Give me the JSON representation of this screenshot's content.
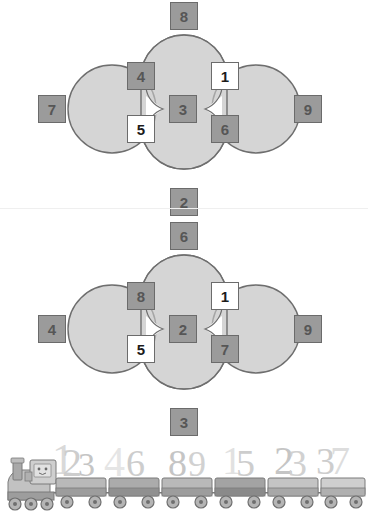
{
  "page": {
    "background_color": "#ffffff",
    "width": 368,
    "height": 516
  },
  "colors": {
    "lobe_fill": "#d5d5d5",
    "lobe_stroke": "#6e6e6e",
    "cell_filled": "#9b9b9b",
    "cell_filled_light": "#a8a8a8",
    "cell_empty": "#ffffff",
    "cell_border": "#6b6b6b",
    "digit_filled": "#565656",
    "digit_empty": "#1c1c1c",
    "train_body": "#b9b9b9",
    "train_dark": "#8f8f8f",
    "train_light": "#d2d2d2",
    "train_outline": "#7a7a7a"
  },
  "puzzles": [
    {
      "id": "puzzle-top",
      "name": "flower-grid-top",
      "cells": [
        {
          "slot": "north",
          "value": "8",
          "state": "filled"
        },
        {
          "slot": "west",
          "value": "7",
          "state": "filled"
        },
        {
          "slot": "east",
          "value": "9",
          "state": "filled"
        },
        {
          "slot": "south",
          "value": "2",
          "state": "filled"
        },
        {
          "slot": "inner-nw",
          "value": "4",
          "state": "filled"
        },
        {
          "slot": "inner-ne",
          "value": "1",
          "state": "empty"
        },
        {
          "slot": "center",
          "value": "3",
          "state": "filled"
        },
        {
          "slot": "inner-sw",
          "value": "5",
          "state": "empty"
        },
        {
          "slot": "inner-se",
          "value": "6",
          "state": "filled"
        }
      ]
    },
    {
      "id": "puzzle-bottom",
      "name": "flower-grid-bottom",
      "cells": [
        {
          "slot": "north",
          "value": "6",
          "state": "filled"
        },
        {
          "slot": "west",
          "value": "4",
          "state": "filled"
        },
        {
          "slot": "east",
          "value": "9",
          "state": "filled"
        },
        {
          "slot": "south",
          "value": "3",
          "state": "filled"
        },
        {
          "slot": "inner-nw",
          "value": "8",
          "state": "filled"
        },
        {
          "slot": "inner-ne",
          "value": "1",
          "state": "empty"
        },
        {
          "slot": "center",
          "value": "2",
          "state": "filled"
        },
        {
          "slot": "inner-sw",
          "value": "5",
          "state": "empty"
        },
        {
          "slot": "inner-se",
          "value": "7",
          "state": "filled"
        }
      ]
    }
  ],
  "train": {
    "name": "number-train-illustration",
    "locomotive": {
      "label": "locomotive"
    },
    "cars": [
      {
        "index": 1,
        "digits": "123"
      },
      {
        "index": 2,
        "digits": "46"
      },
      {
        "index": 3,
        "digits": "89"
      },
      {
        "index": 4,
        "digits": "15"
      },
      {
        "index": 5,
        "digits": "23"
      },
      {
        "index": 6,
        "digits": "37"
      }
    ]
  }
}
